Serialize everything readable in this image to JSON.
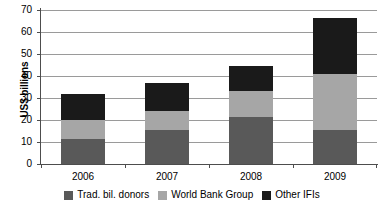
{
  "chart_data": {
    "type": "bar",
    "subtype": "stacked-bar",
    "title": "",
    "xlabel": "",
    "ylabel": "US$ billions",
    "categories": [
      "2006",
      "2007",
      "2008",
      "2009"
    ],
    "ylim": [
      0,
      70
    ],
    "yticks": [
      0,
      10,
      20,
      30,
      40,
      50,
      60,
      70
    ],
    "ytick_labels": [
      "0",
      "10",
      "20",
      "30",
      "40",
      "50",
      "60",
      "70"
    ],
    "grid": true,
    "legend_position": "bottom",
    "series": [
      {
        "name": "Trad. bil. donors",
        "color": "#595959",
        "values": [
          11.5,
          15.5,
          21.5,
          15.5
        ]
      },
      {
        "name": "World Bank Group",
        "color": "#a6a6a6",
        "values": [
          8.5,
          8.5,
          11.5,
          25.5
        ]
      },
      {
        "name": "Other IFIs",
        "color": "#1a1a1a",
        "values": [
          12.0,
          13.0,
          11.5,
          25.5
        ]
      }
    ],
    "totals": [
      32.0,
      37.0,
      44.5,
      66.5
    ]
  }
}
